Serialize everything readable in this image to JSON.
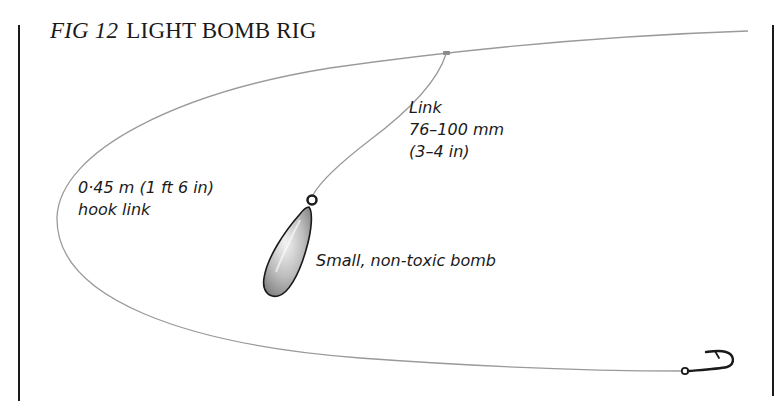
{
  "figure": {
    "number_label": "FIG 12",
    "title": "LIGHT BOMB RIG"
  },
  "labels": {
    "hook_link": {
      "line1": "0·45 m (1 ft 6 in)",
      "line2": "hook link"
    },
    "link": {
      "line1": "Link",
      "line2": "76–100 mm",
      "line3": "(3–4 in)"
    },
    "bomb": "Small, non-toxic bomb"
  },
  "colors": {
    "line": "#9a9a9a",
    "ink": "#1a1a1a",
    "bomb_fill": "#c8c8c8"
  }
}
